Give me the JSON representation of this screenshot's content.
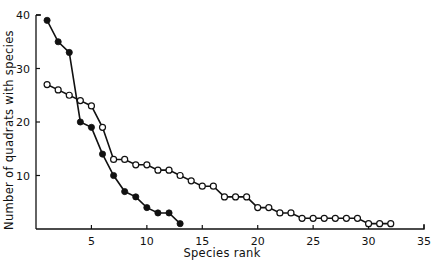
{
  "chart_data": {
    "type": "line",
    "title": "",
    "xlabel": "Species rank",
    "ylabel": "Number of quadrats with species",
    "xlim": [
      0,
      35
    ],
    "ylim": [
      0,
      40
    ],
    "xticks": [
      5,
      10,
      15,
      20,
      25,
      30,
      35
    ],
    "xtick_labels": [
      "5",
      "10",
      "15",
      "20",
      "25",
      "30",
      "35"
    ],
    "yticks": [
      10,
      20,
      30,
      40
    ],
    "ytick_labels": [
      "10",
      "20",
      "30",
      "40"
    ],
    "grid": false,
    "legend": null,
    "series": [
      {
        "name": "filled-markers",
        "marker": "filled-circle",
        "color": "#111111",
        "x": [
          1,
          2,
          3,
          4,
          5,
          6,
          7,
          8,
          9,
          10,
          11,
          12,
          13
        ],
        "values": [
          39,
          35,
          33,
          20,
          19,
          14,
          10,
          7,
          6,
          4,
          3,
          3,
          1
        ]
      },
      {
        "name": "open-markers",
        "marker": "open-circle",
        "color": "#111111",
        "x": [
          1,
          2,
          3,
          4,
          5,
          6,
          7,
          8,
          9,
          10,
          11,
          12,
          13,
          14,
          15,
          16,
          17,
          18,
          19,
          20,
          21,
          22,
          23,
          24,
          25,
          26,
          27,
          28,
          29,
          30,
          31,
          32
        ],
        "values": [
          27,
          26,
          25,
          24,
          23,
          19,
          13,
          13,
          12,
          12,
          11,
          11,
          10,
          9,
          8,
          8,
          6,
          6,
          6,
          4,
          4,
          3,
          3,
          2,
          2,
          2,
          2,
          2,
          2,
          1,
          1,
          1
        ]
      }
    ]
  }
}
